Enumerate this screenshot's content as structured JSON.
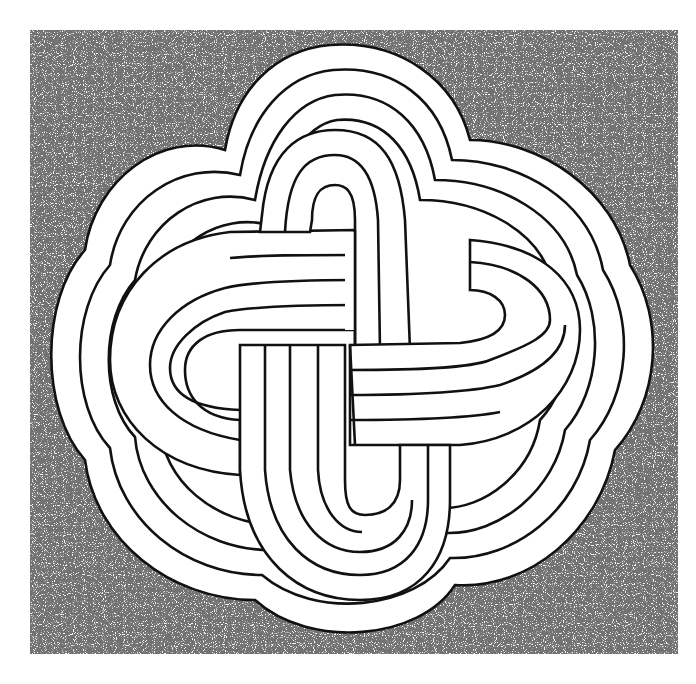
{
  "image": {
    "description": "Black-and-white pen illustration of an interlaced quatrefoil knot (Solomon's knot style) made of multi-strand bands, surrounded by concentric lobed outlines and stippled shading",
    "background_color": "#ffffff",
    "line_color": "#111111",
    "stipple_color": "#333333"
  }
}
